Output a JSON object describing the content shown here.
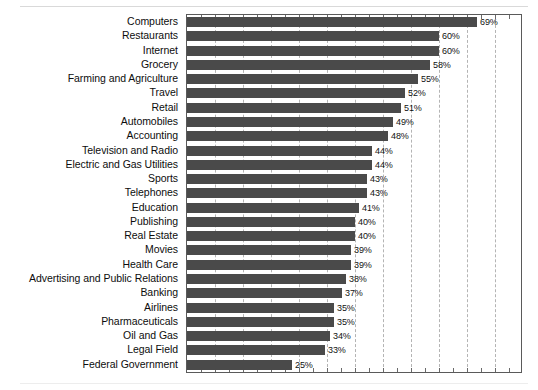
{
  "chart_data": {
    "type": "bar",
    "orientation": "horizontal",
    "title": "",
    "subtitle": "",
    "xlabel": "",
    "ylabel": "",
    "xlim": [
      0,
      79.6
    ],
    "grid": true,
    "gridline_interval_percent": 6.67,
    "legend": "none",
    "value_label_suffix": "%",
    "bar_color": "#4a4a4a",
    "plot_border_color": "#5a5a5a",
    "gridline_color": "#b4b4b4",
    "categories": [
      "Computers",
      "Restaurants",
      "Internet",
      "Grocery",
      "Farming and Agriculture",
      "Travel",
      "Retail",
      "Automobiles",
      "Accounting",
      "Television and Radio",
      "Electric and Gas Utilities",
      "Sports",
      "Telephones",
      "Education",
      "Publishing",
      "Real Estate",
      "Movies",
      "Health Care",
      "Advertising and Public Relations",
      "Banking",
      "Airlines",
      "Pharmaceuticals",
      "Oil and Gas",
      "Legal Field",
      "Federal Government"
    ],
    "values": [
      69,
      60,
      60,
      58,
      55,
      52,
      51,
      49,
      48,
      44,
      44,
      43,
      43,
      41,
      40,
      40,
      39,
      39,
      38,
      37,
      35,
      35,
      34,
      33,
      25
    ],
    "value_labels": [
      "69%",
      "60%",
      "60%",
      "58%",
      "55%",
      "52%",
      "51%",
      "49%",
      "48%",
      "44%",
      "44%",
      "43%",
      "43%",
      "41%",
      "40%",
      "40%",
      "39%",
      "39%",
      "38%",
      "37%",
      "35%",
      "35%",
      "34%",
      "33%",
      "25%"
    ]
  }
}
